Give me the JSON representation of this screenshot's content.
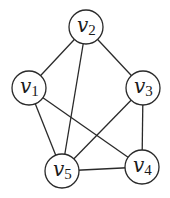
{
  "graph": {
    "title": "",
    "nodes": [
      {
        "id": "v1",
        "base": "v",
        "sub": "1",
        "x": 29,
        "y": 88
      },
      {
        "id": "v2",
        "base": "v",
        "sub": "2",
        "x": 86,
        "y": 27
      },
      {
        "id": "v3",
        "base": "v",
        "sub": "3",
        "x": 143,
        "y": 88
      },
      {
        "id": "v4",
        "base": "v",
        "sub": "4",
        "x": 142,
        "y": 167
      },
      {
        "id": "v5",
        "base": "v",
        "sub": "5",
        "x": 62,
        "y": 171
      }
    ],
    "edges": [
      [
        "v1",
        "v2"
      ],
      [
        "v2",
        "v3"
      ],
      [
        "v2",
        "v5"
      ],
      [
        "v1",
        "v5"
      ],
      [
        "v1",
        "v4"
      ],
      [
        "v3",
        "v5"
      ],
      [
        "v3",
        "v4"
      ],
      [
        "v5",
        "v4"
      ]
    ],
    "node_radius": 17,
    "colors": {
      "stroke": "#2a2a2a",
      "fill": "#ffffff",
      "text": "#1a1a1a"
    }
  }
}
